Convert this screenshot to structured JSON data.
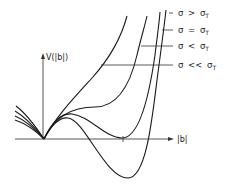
{
  "diagram": {
    "type": "potential-curves",
    "y_axis_label": "V(|b|)",
    "x_axis_label": "|b|",
    "legend": [
      {
        "symbol": "σ",
        "relation": ">",
        "ref": "σ",
        "subscript": "T",
        "text": "σ > σT"
      },
      {
        "symbol": "σ",
        "relation": "=",
        "ref": "σ",
        "subscript": "T",
        "text": "σ = σT"
      },
      {
        "symbol": "σ",
        "relation": "<",
        "ref": "σ",
        "subscript": "T",
        "text": "σ < σT"
      },
      {
        "symbol": "σ",
        "relation": "<<",
        "ref": "σ",
        "subscript": "T",
        "text": "σ << σT"
      }
    ],
    "curves": [
      {
        "name": "sigma-greater-than-sigma-T",
        "description": "monotonically increasing from origin"
      },
      {
        "name": "sigma-equal-sigma-T",
        "description": "inflection plateau then rises"
      },
      {
        "name": "sigma-less-than-sigma-T",
        "description": "local max then second minimum touching zero"
      },
      {
        "name": "sigma-much-less-than-sigma-T",
        "description": "local max then deep minimum below zero"
      }
    ],
    "colors": {
      "line": "#1a1a1a",
      "axis": "#444444",
      "background": "#ffffff"
    }
  }
}
